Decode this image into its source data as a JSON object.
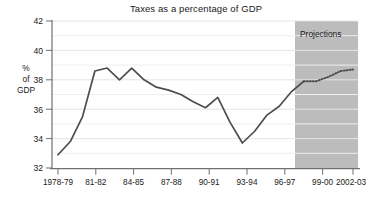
{
  "chart_data": {
    "type": "line",
    "title": "Taxes as a percentage of GDP",
    "xlabel": "",
    "ylabel": "% of GDP",
    "ylabel_lines": [
      "%",
      "of",
      "GDP"
    ],
    "ylim": [
      32,
      42
    ],
    "yticks": [
      32,
      34,
      36,
      38,
      40,
      42
    ],
    "ytick_labels": [
      "32",
      "34",
      "36",
      "38",
      "40",
      "42"
    ],
    "grid": true,
    "grid_interval": 1,
    "legend": "none",
    "annotations": [
      {
        "text": "Projections",
        "region": "shaded-band",
        "from": "1998-99",
        "to": "2002-03"
      }
    ],
    "categories": [
      "1978-79",
      "1979-80",
      "1980-81",
      "1981-82",
      "1982-83",
      "1983-84",
      "1984-85",
      "1985-86",
      "1986-87",
      "1987-88",
      "1988-89",
      "1989-90",
      "1990-91",
      "1991-92",
      "1992-93",
      "1993-94",
      "1994-95",
      "1995-96",
      "1996-97",
      "1997-98",
      "1998-99",
      "1999-00",
      "2000-01",
      "2001-02",
      "2002-03"
    ],
    "xtick_labels": [
      "1978-79",
      "81-82",
      "84-85",
      "87-88",
      "90-91",
      "93-94",
      "96-97",
      "99-00",
      "2002-03"
    ],
    "series": [
      {
        "name": "Taxes as % of GDP (outcome)",
        "style": "solid",
        "values": [
          32.9,
          33.8,
          35.5,
          38.6,
          38.8,
          38.0,
          38.8,
          38.0,
          37.5,
          37.3,
          37.0,
          36.5,
          36.1,
          36.8,
          35.1,
          33.7,
          34.5,
          35.6,
          36.2,
          37.2,
          37.9,
          null,
          null,
          null,
          null
        ]
      },
      {
        "name": "Taxes as % of GDP (projection)",
        "style": "dotted",
        "values": [
          null,
          null,
          null,
          null,
          null,
          null,
          null,
          null,
          null,
          null,
          null,
          null,
          null,
          null,
          null,
          null,
          null,
          null,
          null,
          null,
          37.9,
          37.9,
          38.2,
          38.6,
          38.7
        ]
      }
    ]
  },
  "colors": {
    "line": "#4d4d4d",
    "grid": "#e9e9ef",
    "axis": "#707070",
    "shade": "#bcbcbc",
    "text": "#1a1a1a",
    "background": "#ffffff"
  }
}
